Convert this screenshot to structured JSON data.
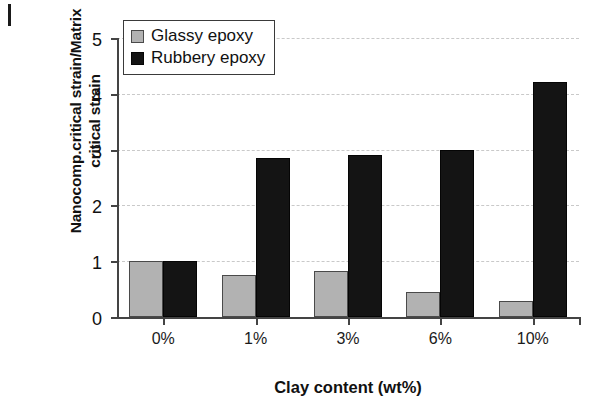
{
  "chart_data": {
    "type": "bar",
    "title": "",
    "subtitle": "",
    "xlabel": "Clay content (wt%)",
    "ylabel": "Nanocomp.critical strain/Matrix\ncritical strain",
    "categories": [
      "0%",
      "1%",
      "3%",
      "6%",
      "10%"
    ],
    "series": [
      {
        "name": "Glassy epoxy",
        "color": "#b2b2b2",
        "values": [
          1.0,
          0.75,
          0.82,
          0.45,
          0.29
        ]
      },
      {
        "name": "Rubbery epoxy",
        "color": "#141414",
        "values": [
          1.0,
          2.85,
          2.9,
          3.0,
          4.22
        ]
      }
    ],
    "ylim": [
      0,
      5
    ],
    "yticks": [
      0,
      1,
      2,
      3,
      4,
      5
    ],
    "ytick_labels": [
      "0",
      "1",
      "2",
      "3",
      "4",
      "5"
    ],
    "grid": true,
    "grid_axis": "y",
    "grid_style": "dashed",
    "legend_position": "top-left",
    "legend_border": true,
    "bar_border_color": "#4a4a4a"
  },
  "axis": {
    "y_title_line1": "Nanocomp.critical strain/Matrix",
    "y_title_line2": "critical strain",
    "x_title": "Clay content (wt%)"
  },
  "legend": {
    "entries": [
      {
        "label": "Glassy epoxy",
        "swatch": "glassy"
      },
      {
        "label": "Rubbery epoxy",
        "swatch": "rubbery"
      }
    ]
  }
}
